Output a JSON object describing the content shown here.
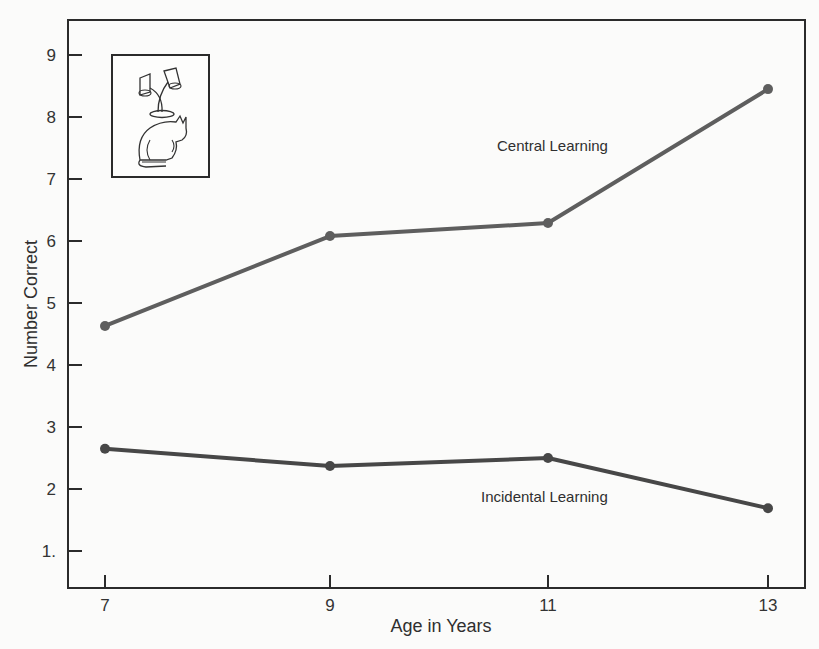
{
  "chart_data": {
    "type": "line",
    "title": "",
    "xlabel": "Age in Years",
    "ylabel": "Number Correct",
    "x": [
      7,
      9,
      11,
      13
    ],
    "x_tick_labels": [
      "7",
      "9",
      "11",
      "13"
    ],
    "y_tick_labels": [
      "1.",
      "2",
      "3",
      "4",
      "5",
      "6",
      "7",
      "8",
      "9"
    ],
    "y_ticks": [
      1,
      2,
      3,
      4,
      5,
      6,
      7,
      8,
      9
    ],
    "ylim": [
      0.4,
      9.6
    ],
    "xlim": [
      6.7,
      13.35
    ],
    "grid": false,
    "legend": "inline labels next to lines",
    "series": [
      {
        "name": "Central Learning",
        "values": [
          4.63,
          6.08,
          6.29,
          8.45
        ],
        "color": "#5e5e5e"
      },
      {
        "name": "Incidental Learning",
        "values": [
          2.65,
          2.37,
          2.5,
          1.69
        ],
        "color": "#474747"
      }
    ],
    "annotations": [
      {
        "type": "inset-illustration",
        "description": "cat sitting under a two-headed lamp, boxed"
      }
    ]
  },
  "labels": {
    "central": "Central Learning",
    "incidental": "Incidental Learning"
  },
  "colors": {
    "axis": "#2b2b2b",
    "central_line": "#5e5e5e",
    "incidental_line": "#474747",
    "background": "#fbfbfa"
  }
}
